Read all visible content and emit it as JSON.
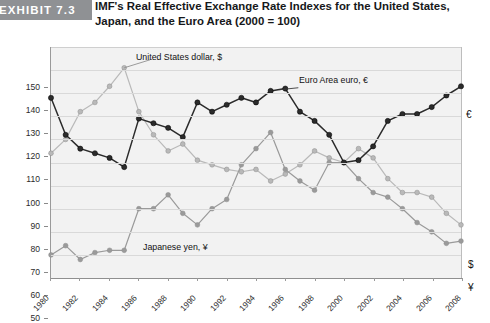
{
  "header": {
    "exhibit_label": "EXHIBIT 7.3",
    "title": "IMF's Real Effective Exchange Rate Indexes for the United States, Japan, and the Euro Area (2000 = 100)"
  },
  "colors": {
    "usd": "#b9b9b9",
    "euro": "#2b2b2b",
    "yen": "#9a9a9a",
    "badge": "#8f9194",
    "plot_background": "#f2f2f2",
    "gridline": "#d9d9d9"
  },
  "annotations": {
    "usd_label": "United States dollar, $",
    "euro_label": "Euro Area euro, €",
    "yen_label": "Japanese yen, ¥",
    "end_euro": "€",
    "end_usd": "$",
    "end_yen": "¥"
  },
  "chart_data": {
    "type": "line",
    "title": "IMF's Real Effective Exchange Rate Indexes for the United States, Japan, and the Euro Area (2000 = 100)",
    "xlabel": "",
    "ylabel": "",
    "xlim": [
      1980,
      2008
    ],
    "ylim": [
      50,
      150
    ],
    "yticks": [
      50,
      60,
      70,
      80,
      90,
      100,
      110,
      120,
      130,
      140,
      150
    ],
    "xticks": [
      1980,
      1982,
      1984,
      1986,
      1988,
      1990,
      1992,
      1994,
      1996,
      1998,
      2000,
      2002,
      2004,
      2006,
      2008
    ],
    "xtick_labels": [
      "1980",
      "1982",
      "1984",
      "1986",
      "1988",
      "1990",
      "1992",
      "1994",
      "1996",
      "1998",
      "2000",
      "2002",
      "2004",
      "2006",
      "2008"
    ],
    "grid": true,
    "legend": "inline-annotations",
    "x": [
      1980,
      1981,
      1982,
      1983,
      1984,
      1985,
      1986,
      1987,
      1988,
      1989,
      1990,
      1991,
      1992,
      1993,
      1994,
      1995,
      1996,
      1997,
      1998,
      1999,
      2000,
      2001,
      2002,
      2003,
      2004,
      2005,
      2006,
      2007,
      2008
    ],
    "series": [
      {
        "name": "United States dollar, $",
        "color": "#b9b9b9",
        "values": [
          104,
          110,
          122,
          126,
          133,
          141,
          122,
          112,
          105,
          108,
          101,
          99,
          97,
          96,
          97,
          92,
          95,
          99,
          105,
          102,
          100,
          106,
          102,
          93,
          87,
          87,
          85,
          78,
          73
        ]
      },
      {
        "name": "Euro Area euro, €",
        "color": "#2b2b2b",
        "values": [
          128,
          112,
          106,
          104,
          102,
          98,
          119,
          117,
          115,
          111,
          126,
          122,
          125,
          128,
          126,
          131,
          132,
          122,
          118,
          112,
          100,
          101,
          107,
          118,
          121,
          121,
          124,
          129,
          133
        ]
      },
      {
        "name": "Japanese yen, ¥",
        "color": "#9a9a9a",
        "values": [
          60,
          64,
          58,
          61,
          62,
          62,
          80,
          80,
          86,
          78,
          73,
          80,
          84,
          99,
          106,
          113,
          97,
          92,
          88,
          100,
          100,
          93,
          87,
          85,
          80,
          74,
          70,
          65,
          66
        ]
      }
    ]
  }
}
